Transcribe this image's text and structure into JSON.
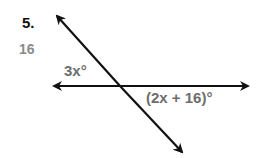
{
  "problem": {
    "number": "5.",
    "answer": "16"
  },
  "diagram": {
    "angle_labels": [
      {
        "text": "3x°",
        "position": "upper-left of intersection"
      },
      {
        "text": "(2x + 16)°",
        "position": "lower-right of intersection"
      }
    ],
    "lines": [
      {
        "type": "horizontal",
        "arrows": "both ends"
      },
      {
        "type": "transversal",
        "direction": "upper-left to lower-right",
        "arrows": "both ends"
      }
    ],
    "line_color": "#111111",
    "label_color": "#6d6d6d"
  }
}
